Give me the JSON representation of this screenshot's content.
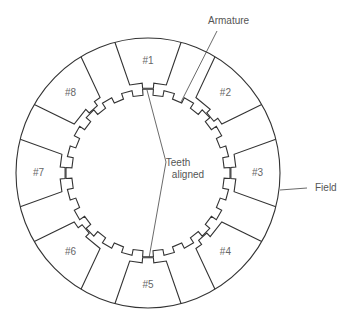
{
  "diagram": {
    "labels": {
      "armature": "Armature",
      "field": "Field",
      "teeth_line1": "Teeth",
      "teeth_line2": "aligned"
    },
    "poles": [
      {
        "id": 1,
        "label": "#1"
      },
      {
        "id": 2,
        "label": "#2"
      },
      {
        "id": 3,
        "label": "#3"
      },
      {
        "id": 4,
        "label": "#4"
      },
      {
        "id": 5,
        "label": "#5"
      },
      {
        "id": 6,
        "label": "#6"
      },
      {
        "id": 7,
        "label": "#7"
      },
      {
        "id": 8,
        "label": "#8"
      }
    ],
    "armature_tooth_count": 24,
    "colors": {
      "line": "#333333",
      "text": "#555555",
      "background": "#ffffff"
    }
  }
}
